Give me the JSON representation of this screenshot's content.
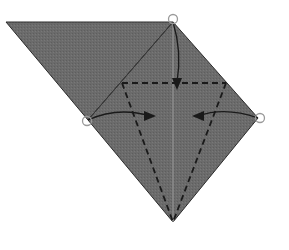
{
  "diagram": {
    "type": "origami-fold-diagram",
    "colors": {
      "paper": "#6b6b6b",
      "edge": "#2a2a2a",
      "crease": "#8a8a8a",
      "fold_line": "#1a1a1a",
      "marker": "#9a9a9a",
      "background": "#ffffff"
    },
    "shapes": {
      "flap_triangle": "6,22 173,22 88,120",
      "kite": "173,22 258,118 173,222 88,120"
    },
    "markers": [
      {
        "name": "top-point-marker",
        "cx": 173,
        "cy": 19
      },
      {
        "name": "left-point-marker",
        "cx": 87,
        "cy": 121
      },
      {
        "name": "right-point-marker",
        "cx": 260,
        "cy": 118
      }
    ],
    "valley_folds": [
      {
        "name": "horizontal-valley-fold",
        "path": "M122,83 L226,83"
      },
      {
        "name": "left-valley-fold",
        "path": "M122,83 L173,222"
      },
      {
        "name": "right-valley-fold",
        "path": "M226,83 L173,222"
      }
    ],
    "arrows": [
      {
        "name": "fold-down-arrow",
        "path": "M173,22 C180,45 180,65 177,82",
        "head": "172,78 182,78 177,90"
      },
      {
        "name": "fold-left-to-center-arrow",
        "path": "M88,120 C110,110 130,110 150,116",
        "head": "144,111 144,121 156,116"
      },
      {
        "name": "fold-right-to-center-arrow",
        "path": "M258,118 C235,110 215,110 198,116",
        "head": "204,111 204,121 192,116"
      }
    ]
  }
}
